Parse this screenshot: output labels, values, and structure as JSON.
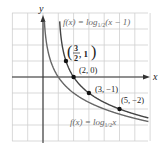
{
  "chart_data": {
    "type": "line",
    "title": "",
    "xlabel": "x",
    "ylabel": "y",
    "xlim": [
      -2,
      7
    ],
    "ylim": [
      -4,
      4
    ],
    "grid": true,
    "series": [
      {
        "name": "f(x) = log_{1/2}(x - 1)",
        "label_main": "f(x) = log",
        "label_sub": "1/2",
        "label_tail": "(x − 1)",
        "color": "#444444",
        "points": [
          [
            1.125,
            3
          ],
          [
            1.25,
            2
          ],
          [
            1.5,
            1
          ],
          [
            2,
            0
          ],
          [
            3,
            -1
          ],
          [
            5,
            -2
          ],
          [
            7,
            -2.585
          ]
        ]
      },
      {
        "name": "f(x) = log_{1/2} x",
        "label_main": "f(x) = log",
        "label_sub": "1/2",
        "label_tail": "x",
        "color": "#666666",
        "points": [
          [
            0.125,
            3
          ],
          [
            0.25,
            2
          ],
          [
            0.5,
            1
          ],
          [
            1,
            0
          ],
          [
            2,
            -1
          ],
          [
            4,
            -2
          ],
          [
            7,
            -2.807
          ]
        ]
      }
    ],
    "annotations": [
      {
        "point": [
          1.5,
          1
        ],
        "label": "(3/2, 1)",
        "num": "3",
        "den": "2",
        "tail": ", 1"
      },
      {
        "point": [
          2,
          0
        ],
        "label": "(2, 0)"
      },
      {
        "point": [
          3,
          -1
        ],
        "label": "(3, −1)"
      },
      {
        "point": [
          5,
          -2
        ],
        "label": "(5, −2)"
      }
    ]
  },
  "axes": {
    "x_label": "x",
    "y_label": "y"
  },
  "labels": {
    "top_curve_main": "f(x) = log",
    "top_curve_sub": "1/2",
    "top_curve_tail": "(x − 1)",
    "bottom_curve_main": "f(x) = log",
    "bottom_curve_sub": "1/2",
    "bottom_curve_tail": "x",
    "pt1_num": "3",
    "pt1_den": "2",
    "pt1_tail": ", 1",
    "pt2": "(2, 0)",
    "pt3": "(3, −1)",
    "pt4": "(5, −2)"
  }
}
